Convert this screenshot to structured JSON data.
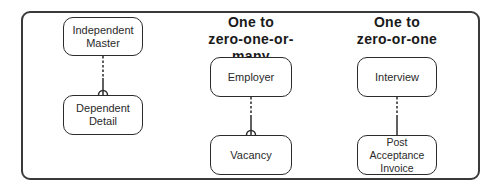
{
  "diagram": {
    "headings": {
      "one_to_many": "One to\nzero-one-or-many",
      "one_to_one": "One to\nzero-or-one"
    },
    "entities": {
      "independent_master": "Independent\nMaster",
      "dependent_detail": "Dependent\nDetail",
      "employer": "Employer",
      "vacancy": "Vacancy",
      "interview": "Interview",
      "post_acceptance_invoice": "Post Acceptance\nInvoice"
    },
    "relationships": [
      {
        "from": "Independent Master",
        "to": "Dependent Detail",
        "optional_end": "dotted",
        "mandatory_end": "solid",
        "cardinality_symbol": "crows-foot"
      },
      {
        "from": "Employer",
        "to": "Vacancy",
        "optional_end": "dotted",
        "mandatory_end": "solid",
        "cardinality_symbol": "crows-foot"
      },
      {
        "from": "Interview",
        "to": "Post Acceptance Invoice",
        "optional_end": "dotted",
        "mandatory_end": "solid",
        "cardinality_symbol": "none"
      }
    ],
    "colors": {
      "line": "#2b2b2b",
      "background": "#ffffff"
    }
  }
}
